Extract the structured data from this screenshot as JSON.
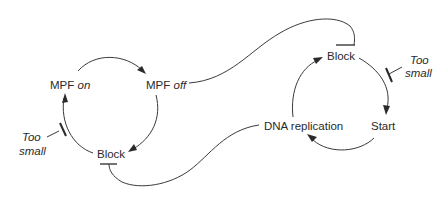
{
  "diagram": {
    "left_cycle": {
      "mpf_on": {
        "prefix": "MPF",
        "state": "on"
      },
      "mpf_off": {
        "prefix": "MPF",
        "state": "off"
      },
      "block": "Block",
      "too_small": {
        "line1": "Too",
        "line2": "small"
      }
    },
    "right_cycle": {
      "block": "Block",
      "start": "Start",
      "dna_replication": "DNA replication",
      "too_small": {
        "line1": "Too",
        "line2": "small"
      }
    },
    "connections": [
      {
        "from": "MPF off",
        "to": "Block (right cycle)",
        "type": "inhibition"
      },
      {
        "from": "DNA replication",
        "to": "Block (left cycle)",
        "type": "inhibition"
      },
      {
        "from": "MPF on",
        "to": "MPF off",
        "type": "activation"
      },
      {
        "from": "MPF off",
        "to": "Block (left cycle)",
        "type": "activation"
      },
      {
        "from": "Block (left cycle)",
        "to": "MPF on",
        "type": "activation",
        "inhibited_by": "Too small"
      },
      {
        "from": "Block (right cycle)",
        "to": "Start",
        "type": "activation",
        "inhibited_by": "Too small"
      },
      {
        "from": "Start",
        "to": "DNA replication",
        "type": "activation"
      },
      {
        "from": "DNA replication",
        "to": "Block (right cycle)",
        "type": "activation"
      }
    ],
    "colors": {
      "ink": "#2a2a2a",
      "background": "#ffffff"
    }
  }
}
